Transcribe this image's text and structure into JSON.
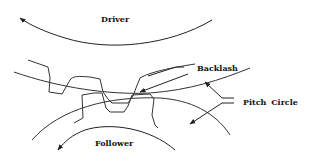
{
  "diagram": {
    "type": "gear-mesh-backlash",
    "labels": {
      "driver": "Driver",
      "follower": "Follower",
      "backlash": "Backlash",
      "pitch_circle": "Pitch Circle"
    },
    "line_color": "#222222",
    "background": "#ffffff"
  }
}
